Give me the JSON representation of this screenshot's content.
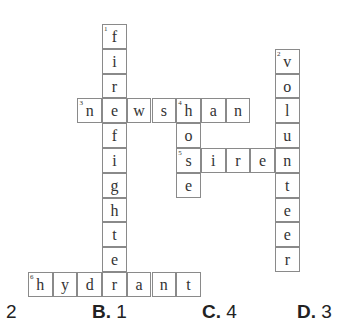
{
  "crossword": {
    "cell_w": 24.7,
    "cell_h": 24.8,
    "origin_x": 28,
    "origin_y": 24,
    "words": [
      {
        "number": "1",
        "direction": "down",
        "answer": "firefighter",
        "col": 3,
        "row": 0
      },
      {
        "number": "2",
        "direction": "down",
        "answer": "volunteer",
        "col": 10,
        "row": 1
      },
      {
        "number": "3",
        "direction": "across",
        "answer": "newshan",
        "col": 2,
        "row": 3
      },
      {
        "number": "4",
        "direction": "down",
        "answer": "hose",
        "col": 6,
        "row": 3
      },
      {
        "number": "5",
        "direction": "across",
        "answer": "siren",
        "col": 6,
        "row": 5
      },
      {
        "number": "6",
        "direction": "across",
        "answer": "hydrant",
        "col": 0,
        "row": 10
      }
    ]
  },
  "answers": {
    "options": [
      {
        "letter": "",
        "value": "2",
        "x": 6
      },
      {
        "letter": "B.",
        "value": "1",
        "x": 92
      },
      {
        "letter": "C.",
        "value": "4",
        "x": 202
      },
      {
        "letter": "D.",
        "value": "3",
        "x": 297
      }
    ]
  }
}
